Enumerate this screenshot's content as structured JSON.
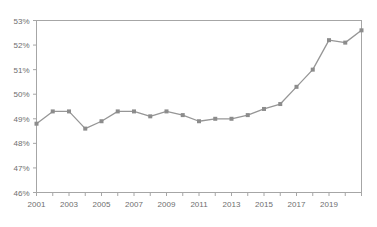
{
  "chart_data": {
    "type": "line",
    "title": "",
    "subtitle": "",
    "xlabel": "",
    "ylabel": "",
    "grid": false,
    "legend": false,
    "legend_position": "none",
    "xlim": [
      2001,
      2021
    ],
    "ylim": [
      46,
      53
    ],
    "y_tick_labels": [
      "46%",
      "47%",
      "48%",
      "49%",
      "50%",
      "51%",
      "52%",
      "53%"
    ],
    "y_tick_values": [
      46,
      47,
      48,
      49,
      50,
      51,
      52,
      53
    ],
    "x_tick_labels": [
      "2001",
      "",
      "2003",
      "",
      "2005",
      "",
      "2007",
      "",
      "2009",
      "",
      "2011",
      "",
      "2013",
      "",
      "2015",
      "",
      "2017",
      "",
      "2019",
      "",
      ""
    ],
    "x_tick_values": [
      2001,
      2002,
      2003,
      2004,
      2005,
      2006,
      2007,
      2008,
      2009,
      2010,
      2011,
      2012,
      2013,
      2014,
      2015,
      2016,
      2017,
      2018,
      2019,
      2020,
      2021
    ],
    "categories": [
      2001,
      2002,
      2003,
      2004,
      2005,
      2006,
      2007,
      2008,
      2009,
      2010,
      2011,
      2012,
      2013,
      2014,
      2015,
      2016,
      2017,
      2018,
      2019,
      2020,
      2021
    ],
    "values": [
      48.8,
      49.3,
      49.3,
      48.6,
      48.9,
      49.3,
      49.3,
      49.1,
      49.3,
      49.15,
      48.9,
      49.0,
      49.0,
      49.15,
      49.4,
      49.6,
      50.3,
      51.0,
      52.2,
      52.1,
      52.6
    ],
    "unit": "%",
    "colors": {
      "line": "#969696",
      "marker": "#8c8c8c",
      "frame": "#a6a6a6",
      "tick_label": "#6e6e6e",
      "background": "#ffffff"
    }
  }
}
